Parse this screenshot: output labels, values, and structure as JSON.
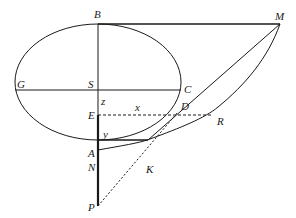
{
  "diagram": {
    "labels": {
      "B": "B",
      "M": "M",
      "G": "G",
      "S": "S",
      "C": "C",
      "z": "z",
      "x": "x",
      "D": "D",
      "E": "E",
      "R": "R",
      "y": "y",
      "A": "A",
      "N": "N",
      "K": "K",
      "P": "P"
    },
    "colors": {
      "stroke": "#1a1a1a",
      "background": "#ffffff"
    }
  }
}
